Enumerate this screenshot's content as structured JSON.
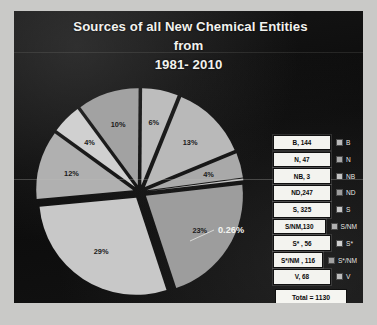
{
  "slide": {
    "background_color": "#0d0d0d",
    "page_background_color": "#c9c9c7"
  },
  "title": {
    "line1": "Sources of all New Chemical Entities",
    "line2": "from",
    "line3": "1981- 2010"
  },
  "legend": {
    "rows": [
      {
        "value": "B, 144",
        "label": "B",
        "swatch": "#b9b9b9"
      },
      {
        "value": "N, 47",
        "label": "N",
        "swatch": "#a9a9a9"
      },
      {
        "value": "NB, 3",
        "label": "NB",
        "swatch": "#c4c4c4"
      },
      {
        "value": "ND,247",
        "label": "ND",
        "swatch": "#9d9d9d"
      },
      {
        "value": "S, 325",
        "label": "S",
        "swatch": "#c8c8c8"
      },
      {
        "value": "S/NM,130",
        "label": "S/NM",
        "swatch": "#b0b0b0"
      },
      {
        "value": "S* , 56",
        "label": "S*",
        "swatch": "#d0d0d0"
      },
      {
        "value": "S*/NM , 116",
        "label": "S*/NM",
        "swatch": "#a2a2a2"
      },
      {
        "value": "V, 68",
        "label": "V",
        "swatch": "#bdbdbd"
      }
    ],
    "total": "Total = 1130"
  },
  "chart_data": {
    "type": "pie",
    "title": "Sources of all New Chemical Entities from 1981- 2010",
    "total": 1130,
    "categories": [
      "B",
      "N",
      "NB",
      "ND",
      "S",
      "S/NM",
      "S*",
      "S*/NM",
      "V"
    ],
    "values": [
      144,
      47,
      3,
      247,
      325,
      130,
      56,
      116,
      68
    ],
    "labels": [
      "13%",
      "4%",
      "0.26%",
      "23%",
      "29%",
      "12%",
      "4%",
      "10%",
      "6%"
    ],
    "exploded": true,
    "legend_position": "right",
    "grid": false,
    "colorscheme": "grayscale",
    "slice_colors": [
      "#b9b9b9",
      "#a9a9a9",
      "#c4c4c4",
      "#9d9d9d",
      "#c8c8c8",
      "#b0b0b0",
      "#d0d0d0",
      "#a2a2a2",
      "#bdbdbd"
    ]
  }
}
